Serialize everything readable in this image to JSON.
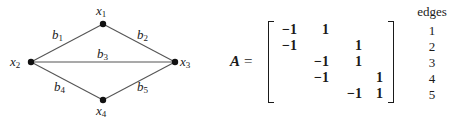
{
  "graph": {
    "nodes": [
      {
        "id": "x1",
        "name": "x",
        "sub": "1",
        "cx": 103,
        "cy": 24
      },
      {
        "id": "x2",
        "name": "x",
        "sub": "2",
        "cx": 31,
        "cy": 62
      },
      {
        "id": "x3",
        "name": "x",
        "sub": "3",
        "cx": 175,
        "cy": 62
      },
      {
        "id": "x4",
        "name": "x",
        "sub": "4",
        "cx": 103,
        "cy": 100
      }
    ],
    "edges": [
      {
        "id": "b1",
        "name": "b",
        "sub": "1",
        "from": "x2",
        "to": "x1"
      },
      {
        "id": "b2",
        "name": "b",
        "sub": "2",
        "from": "x1",
        "to": "x3"
      },
      {
        "id": "b3",
        "name": "b",
        "sub": "3",
        "from": "x2",
        "to": "x3"
      },
      {
        "id": "b4",
        "name": "b",
        "sub": "4",
        "from": "x2",
        "to": "x4"
      },
      {
        "id": "b5",
        "name": "b",
        "sub": "5",
        "from": "x4",
        "to": "x3"
      }
    ],
    "labels": {
      "x1": {
        "name": "x",
        "sub": "1"
      },
      "x2": {
        "name": "x",
        "sub": "2"
      },
      "x3": {
        "name": "x",
        "sub": "3"
      },
      "x4": {
        "name": "x",
        "sub": "4"
      },
      "b1": {
        "name": "b",
        "sub": "1"
      },
      "b2": {
        "name": "b",
        "sub": "2"
      },
      "b3": {
        "name": "b",
        "sub": "3"
      },
      "b4": {
        "name": "b",
        "sub": "4"
      },
      "b5": {
        "name": "b",
        "sub": "5"
      }
    }
  },
  "matrix": {
    "name": "A",
    "equals": "=",
    "rows": [
      [
        "−1",
        "1",
        "",
        ""
      ],
      [
        "−1",
        "",
        "1",
        ""
      ],
      [
        "",
        "−1",
        "1",
        ""
      ],
      [
        "",
        "−1",
        "",
        "1"
      ],
      [
        "",
        "",
        "−1",
        "1"
      ]
    ]
  },
  "edges_column": {
    "header": "edges",
    "values": [
      "1",
      "2",
      "3",
      "4",
      "5"
    ]
  },
  "colors": {
    "ink": "#1a1a1a",
    "edge_line": "#555555",
    "background": "#ffffff"
  }
}
